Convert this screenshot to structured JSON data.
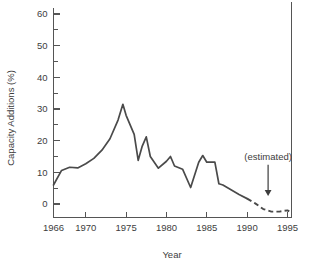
{
  "chart_data": {
    "type": "line",
    "title": "",
    "xlabel": "Year",
    "ylabel": "Capacity Additions (%)",
    "xlim": [
      1966,
      1995.5
    ],
    "ylim": [
      -4,
      63
    ],
    "grid": false,
    "legend": "none",
    "line_color": "#4a4a4a",
    "axis_color": "#555555",
    "text_color": "#3d3d3d",
    "x_ticks": [
      1966,
      1970,
      1975,
      1980,
      1985,
      1990,
      1995
    ],
    "x_tick_labels": [
      "1966",
      "1970",
      "1975",
      "1980",
      "1985",
      "1990",
      "1995"
    ],
    "y_ticks": [
      0,
      10,
      20,
      30,
      40,
      50,
      60
    ],
    "y_tick_labels": [
      "0",
      "10",
      "20",
      "30",
      "40",
      "50",
      "60"
    ],
    "y_minor_ticks": [
      5,
      15,
      25,
      35,
      45,
      55
    ],
    "annotations": [
      {
        "text": "(estimated)",
        "x": 1992.6,
        "y": 14,
        "arrow_to_x": 1992.6,
        "arrow_to_y": 2.5
      }
    ],
    "series": [
      {
        "name": "Capacity Additions (actual)",
        "style": "solid",
        "x": [
          1966,
          1967,
          1968,
          1969,
          1970,
          1971,
          1972,
          1973,
          1974,
          1974.6,
          1975,
          1976,
          1976.5,
          1977,
          1977.5,
          1978,
          1979,
          1980,
          1980.5,
          1981,
          1982,
          1983,
          1984,
          1984.5,
          1985,
          1986,
          1986.5,
          1987,
          1988,
          1989,
          1990
        ],
        "y": [
          6.0,
          10.6,
          11.6,
          11.4,
          12.7,
          14.4,
          17.0,
          20.6,
          26.5,
          31.5,
          28.0,
          22.0,
          13.8,
          18.3,
          21.2,
          15.0,
          11.3,
          13.5,
          15.0,
          12.0,
          11.0,
          5.2,
          13.2,
          15.3,
          13.2,
          13.2,
          6.4,
          6.0,
          4.5,
          3.0,
          1.7
        ]
      },
      {
        "name": "Capacity Additions (estimated)",
        "style": "dashed",
        "x": [
          1990,
          1991,
          1992,
          1993,
          1994,
          1995,
          1995.4
        ],
        "y": [
          1.7,
          0.2,
          -1.6,
          -2.4,
          -2.4,
          -2.0,
          -2.6
        ]
      }
    ]
  }
}
